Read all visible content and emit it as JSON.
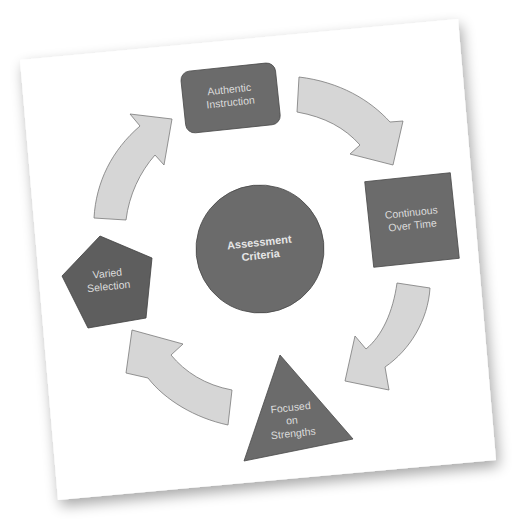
{
  "diagram": {
    "type": "cycle",
    "center": {
      "label_line1": "Assessment",
      "label_line2": "Criteria",
      "shape": "circle"
    },
    "nodes": [
      {
        "id": "authentic-instruction",
        "line1": "Authentic",
        "line2": "Instruction",
        "shape": "rounded-rectangle"
      },
      {
        "id": "continuous-over-time",
        "line1": "Continuous",
        "line2": "Over Time",
        "shape": "square"
      },
      {
        "id": "focused-on-strengths",
        "line1": "Focused",
        "line2": "on",
        "line3": "Strengths",
        "shape": "triangle"
      },
      {
        "id": "varied-selection",
        "line1": "Varied",
        "line2": "Selection",
        "shape": "pentagon"
      }
    ],
    "arrows": [
      {
        "from": "authentic-instruction",
        "to": "continuous-over-time"
      },
      {
        "from": "continuous-over-time",
        "to": "focused-on-strengths"
      },
      {
        "from": "focused-on-strengths",
        "to": "varied-selection"
      },
      {
        "from": "varied-selection",
        "to": "authentic-instruction"
      }
    ],
    "colors": {
      "node_fill": "#6b6b6b",
      "node_stroke": "#4a4a4a",
      "arrow_fill": "#d6d6d6",
      "arrow_stroke": "#7a7a7a",
      "card_background": "#ffffff",
      "text": "#e0e0e0"
    }
  }
}
